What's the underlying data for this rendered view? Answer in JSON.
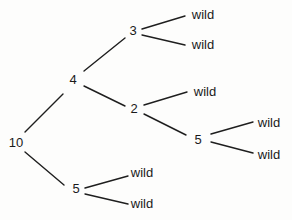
{
  "diagram": {
    "type": "tree",
    "nodes": [
      {
        "id": "n10",
        "label": "10",
        "x": 16,
        "y": 142
      },
      {
        "id": "n4",
        "label": "4",
        "x": 73,
        "y": 79
      },
      {
        "id": "n3",
        "label": "3",
        "x": 133,
        "y": 30
      },
      {
        "id": "n2",
        "label": "2",
        "x": 134,
        "y": 108
      },
      {
        "id": "n5a",
        "label": "5",
        "x": 198,
        "y": 139
      },
      {
        "id": "n5b",
        "label": "5",
        "x": 76,
        "y": 188
      },
      {
        "id": "w1",
        "label": "wild",
        "x": 203,
        "y": 14
      },
      {
        "id": "w2",
        "label": "wild",
        "x": 203,
        "y": 44
      },
      {
        "id": "w3",
        "label": "wild",
        "x": 205,
        "y": 91
      },
      {
        "id": "w4",
        "label": "wild",
        "x": 269,
        "y": 122
      },
      {
        "id": "w5",
        "label": "wild",
        "x": 269,
        "y": 154
      },
      {
        "id": "w6",
        "label": "wild",
        "x": 142,
        "y": 172
      },
      {
        "id": "w7",
        "label": "wild",
        "x": 142,
        "y": 203
      }
    ],
    "edges": [
      {
        "from": "n10",
        "to": "n4",
        "x1": 25,
        "y1": 132,
        "x2": 63,
        "y2": 94
      },
      {
        "from": "n10",
        "to": "n5b",
        "x1": 25,
        "y1": 152,
        "x2": 64,
        "y2": 185
      },
      {
        "from": "n4",
        "to": "n3",
        "x1": 84,
        "y1": 71,
        "x2": 125,
        "y2": 38
      },
      {
        "from": "n4",
        "to": "n2",
        "x1": 84,
        "y1": 86,
        "x2": 125,
        "y2": 106
      },
      {
        "from": "n3",
        "to": "w1",
        "x1": 142,
        "y1": 29,
        "x2": 185,
        "y2": 16
      },
      {
        "from": "n3",
        "to": "w2",
        "x1": 142,
        "y1": 35,
        "x2": 185,
        "y2": 45
      },
      {
        "from": "n2",
        "to": "w3",
        "x1": 144,
        "y1": 105,
        "x2": 187,
        "y2": 92
      },
      {
        "from": "n2",
        "to": "n5a",
        "x1": 144,
        "y1": 114,
        "x2": 186,
        "y2": 135
      },
      {
        "from": "n5a",
        "to": "w4",
        "x1": 211,
        "y1": 134,
        "x2": 253,
        "y2": 122
      },
      {
        "from": "n5a",
        "to": "w5",
        "x1": 211,
        "y1": 142,
        "x2": 253,
        "y2": 153
      },
      {
        "from": "n5b",
        "to": "w6",
        "x1": 85,
        "y1": 188,
        "x2": 128,
        "y2": 176
      },
      {
        "from": "n5b",
        "to": "w7",
        "x1": 85,
        "y1": 194,
        "x2": 128,
        "y2": 204
      }
    ]
  }
}
